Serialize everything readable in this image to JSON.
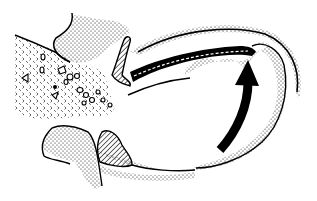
{
  "diagram": {
    "type": "anatomical-line-illustration",
    "width": 317,
    "height": 201,
    "colors": {
      "background": "#ffffff",
      "ink": "#000000"
    },
    "regions": [
      {
        "id": "left-mass",
        "fill": "chevron-pattern-with-particles",
        "label": ""
      },
      {
        "id": "upper-bone",
        "fill": "stipple",
        "label": ""
      },
      {
        "id": "lower-bone",
        "fill": "stipple",
        "label": ""
      },
      {
        "id": "upper-hatched-process",
        "fill": "diagonal-hatch",
        "label": ""
      },
      {
        "id": "lower-hatched-mass",
        "fill": "diagonal-hatch",
        "label": ""
      },
      {
        "id": "channel-band",
        "fill": "hatch-with-dashes",
        "label": ""
      },
      {
        "id": "right-cavity-wall",
        "fill": "stipple",
        "label": ""
      }
    ],
    "arrow": {
      "id": "curved-arrow",
      "direction": "up",
      "style": "bold-black"
    },
    "text_labels": []
  }
}
